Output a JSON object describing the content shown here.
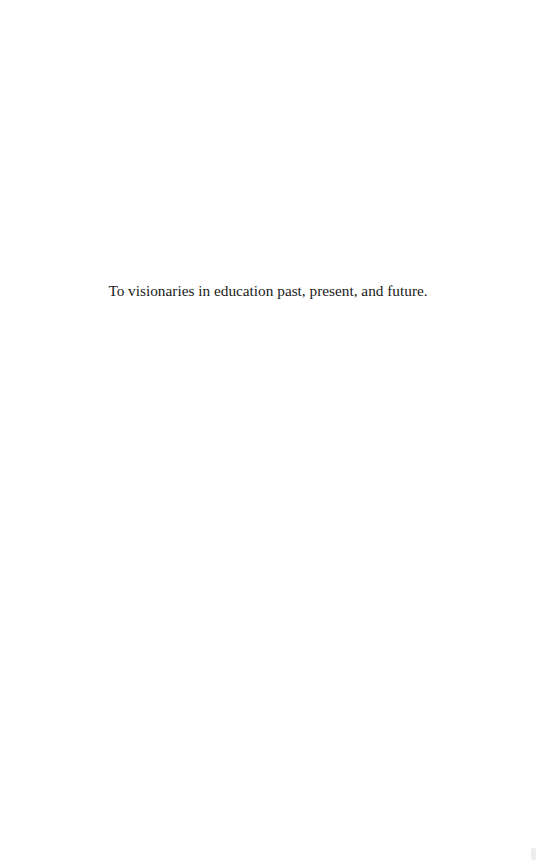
{
  "page": {
    "type": "dedication",
    "dedication_text": "To visionaries in education past, present, and future."
  },
  "colors": {
    "background": "#ffffff",
    "text": "#1a1a1a"
  }
}
